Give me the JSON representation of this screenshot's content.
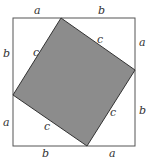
{
  "diagram": {
    "colors": {
      "background": "#ffffff",
      "outer_stroke": "#555555",
      "inner_fill": "#8c8c8c",
      "inner_stroke": "#333333",
      "label": "#333333"
    },
    "outer_square": {
      "x1": 13,
      "y1": 18,
      "x2": 135,
      "y2": 146
    },
    "inner_square": {
      "top": {
        "x": 61,
        "y": 18
      },
      "right": {
        "x": 135,
        "y": 70
      },
      "bottom": {
        "x": 87,
        "y": 146
      },
      "left": {
        "x": 13,
        "y": 95
      }
    },
    "labels": {
      "top_a": "a",
      "top_b": "b",
      "right_a": "a",
      "right_b": "b",
      "bottom_b": "b",
      "bottom_a": "a",
      "left_b": "b",
      "left_a": "a",
      "c_top_left": "c",
      "c_top_right": "c",
      "c_bottom_left": "c",
      "c_bottom_right": "c"
    }
  }
}
